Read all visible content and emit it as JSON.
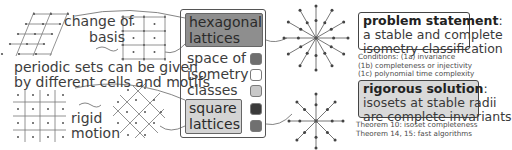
{
  "left_panel": {
    "change_of_basis_line1": "change of",
    "change_of_basis_line2": "basis",
    "periodic_sets_line1": "periodic sets can be given",
    "periodic_sets_line2": "by different cells and motifs",
    "rigid_motion_line1": "rigid",
    "rigid_motion_line2": "motion"
  },
  "space_panel": {
    "hexagonal_line1": "hexagonal",
    "hexagonal_line2": "lattices",
    "space_line1": "space of",
    "space_line2": "isometry",
    "space_line3": "classes",
    "square_line1": "square",
    "square_line2": "lattices",
    "swatches": [
      "#6e6e6e",
      "#ffffff",
      "#c8c8c8",
      "#3a3a3a",
      "#707070"
    ]
  },
  "right_panel": {
    "problem_title": "problem statement",
    "problem_colon": ":",
    "problem_line2": "a stable and complete",
    "problem_line3": "isometry classification",
    "conditions_line1": "Conditions: (1a) invariance",
    "conditions_line2": "(1b) completeness or injectivity",
    "conditions_line3": "(1c) polynomial time complexity",
    "solution_title": "rigorous solution",
    "solution_colon": ":",
    "solution_line2": "isosets at stable radii",
    "solution_line3": "are complete invariants",
    "theorem_line1": "Theorem 10: isoset completeness",
    "theorem_line2": "Theorem 14, 15: fast algorithms"
  },
  "colors": {
    "line": "#666666",
    "dot": "#444444",
    "hex_fill": "#8e8e8e",
    "square_fill": "#d4d4d4",
    "solution_fill": "#d9d9d9"
  }
}
